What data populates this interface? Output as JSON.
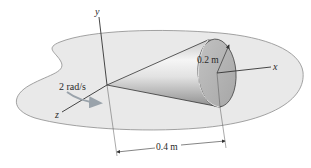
{
  "diagram": {
    "type": "cone-rotation-figure",
    "axes": {
      "x_label": "x",
      "y_label": "y",
      "z_label": "z"
    },
    "labels": {
      "radius": "0.2 m",
      "length": "0.4 m",
      "angular_velocity": "2 rad/s"
    },
    "colors": {
      "surface": "#e9e9e9",
      "surface_edge": "#8c8c8c",
      "cone_light": "#f4f4f4",
      "cone_dark": "#9a9a9a",
      "base_face": "#b4b4b4",
      "lines": "#333333",
      "rotation_arrow": "#9aa3ab"
    }
  }
}
